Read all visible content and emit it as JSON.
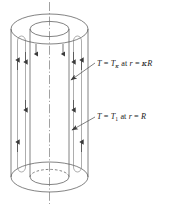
{
  "figure": {
    "name": "annular-cylinder-heat-transfer-diagram",
    "type": "technical-line-drawing",
    "background_color": "#ffffff",
    "line_color": "#555555",
    "text_color": "#1a1a1a"
  },
  "labels": {
    "inner_wall": {
      "full_text": "T = Tκ at r = κR",
      "t_symbol": "T",
      "eq1": " = ",
      "t_sub_symbol": "T",
      "t_subscript": "κ",
      "at_text": " at ",
      "r_symbol": "r",
      "eq2": " = ",
      "radius_expr_kappa": "κ",
      "radius_expr_R": "R"
    },
    "outer_wall": {
      "full_text": "T = T1 at r = R",
      "t_symbol": "T",
      "eq1": " = ",
      "t_sub_symbol": "T",
      "t_subscript": "1",
      "at_text": " at ",
      "r_symbol": "r",
      "eq2": " = ",
      "radius_expr_R": "R"
    }
  },
  "geometry": {
    "outer_cylinder": {
      "left": 11,
      "right": 88,
      "top_cy": 29,
      "bottom_cy": 177,
      "ry": 15
    },
    "inner_cylinder": {
      "left": 30,
      "right": 69,
      "top_cy": 29,
      "bottom_cy": 177,
      "ry": 7.5
    },
    "axis": {
      "x": 49.5,
      "top": 2,
      "bottom": 204,
      "style": "dash-dot"
    }
  },
  "flow_arrows": {
    "outer_direction": "up",
    "inner_direction": "down",
    "description": "upward flow along outer annulus walls, downward flow along inner cylinder walls"
  }
}
